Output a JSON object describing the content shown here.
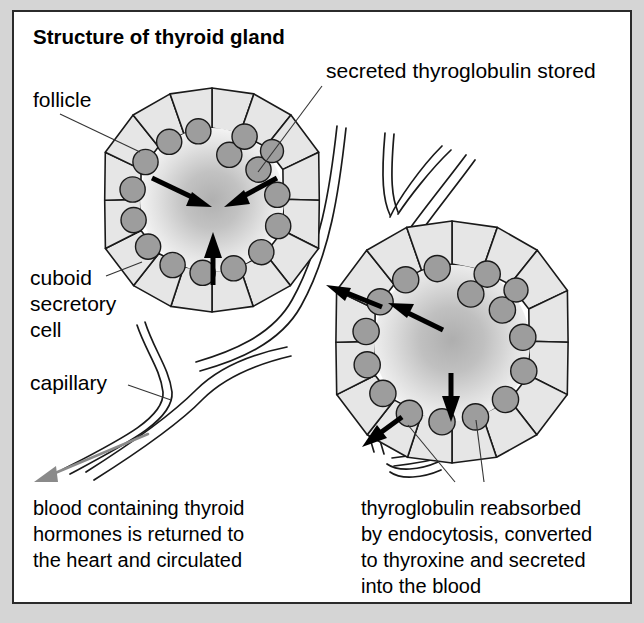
{
  "figure": {
    "title": "Structure of thyroid gland",
    "background_color": "#d5d5d5",
    "panel_color": "#ffffff",
    "border_color": "#2b2b2b"
  },
  "labels": {
    "follicle": "follicle",
    "secreted": "secreted thyroglobulin stored",
    "cuboid_line1": "cuboid",
    "cuboid_line2": "secretory",
    "cuboid_line3": "cell",
    "capillary": "capillary"
  },
  "captions": {
    "left": {
      "line1": "blood containing thyroid",
      "line2": "hormones is returned to",
      "line3": "the heart and circulated"
    },
    "right": {
      "line1": "thyroglobulin reabsorbed",
      "line2": "by endocytosis, converted",
      "line3": "to thyroxine and secreted",
      "line4": "into the blood"
    }
  },
  "colors": {
    "cell_fill": "#e6e6e6",
    "nucleus_fill": "#9d9d9d",
    "outline": "#1a1a1a",
    "lumen_center": "#b4b4b4",
    "lumen_edge": "#f2f2f2",
    "flow_arrow": "#8a8a8a"
  },
  "follicles": [
    {
      "name": "upper-left-follicle",
      "cx": 212,
      "cy": 200,
      "lumen_r": 72,
      "cell_count": 16,
      "cell_depth": 36,
      "arrow_direction": "inward",
      "meaning": "secreted thyroglobulin stored"
    },
    {
      "name": "lower-right-follicle",
      "cx": 452,
      "cy": 343,
      "lumen_r": 78,
      "cell_count": 16,
      "cell_depth": 37,
      "arrow_direction": "outward",
      "meaning": "thyroglobulin reabsorbed by endocytosis"
    }
  ]
}
